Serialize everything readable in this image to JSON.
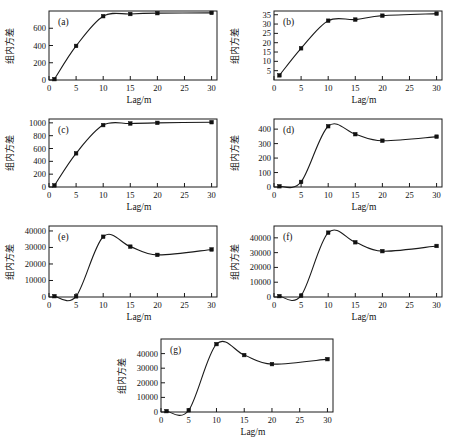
{
  "figure": {
    "background": "#ffffff",
    "marker_color": "#111111",
    "line_color": "#1a1a1a",
    "panel_count": 7
  },
  "chart_data": [
    {
      "type": "line",
      "panel": "(a)",
      "title": "",
      "xlabel": "Lag/m",
      "ylabel": "组内方差",
      "xlim": [
        0,
        31
      ],
      "ylim": [
        0,
        800
      ],
      "xticks": [
        0,
        5,
        10,
        15,
        20,
        25,
        30
      ],
      "xticklabels": [
        "0",
        "5",
        "10",
        "15",
        "20",
        "25",
        "30"
      ],
      "yticks": [
        0,
        200,
        400,
        600
      ],
      "yticklabels": [
        "0",
        "200",
        "400",
        "600"
      ],
      "grid": false,
      "x": [
        1,
        5,
        10,
        15,
        20,
        30
      ],
      "values": [
        10,
        395,
        740,
        765,
        775,
        778
      ]
    },
    {
      "type": "line",
      "panel": "(b)",
      "title": "",
      "xlabel": "Lag/m",
      "ylabel": "组内方差",
      "xlim": [
        0,
        31
      ],
      "ylim": [
        0,
        37
      ],
      "xticks": [
        0,
        5,
        10,
        15,
        20,
        25,
        30
      ],
      "xticklabels": [
        "0",
        "5",
        "10",
        "15",
        "20",
        "25",
        "30"
      ],
      "yticks": [
        5,
        10,
        15,
        20,
        25,
        30,
        35
      ],
      "yticklabels": [
        "5",
        "10",
        "15",
        "20",
        "25",
        "30",
        "35"
      ],
      "grid": false,
      "x": [
        1,
        5,
        10,
        15,
        20,
        30
      ],
      "values": [
        2.5,
        17,
        31.8,
        32.4,
        34.5,
        35.6
      ]
    },
    {
      "type": "line",
      "panel": "(c)",
      "title": "",
      "xlabel": "Lag/m",
      "ylabel": "组内方差",
      "xlim": [
        0,
        31
      ],
      "ylim": [
        0,
        1060
      ],
      "xticks": [
        0,
        5,
        10,
        15,
        20,
        25,
        30
      ],
      "xticklabels": [
        "0",
        "5",
        "10",
        "15",
        "20",
        "25",
        "30"
      ],
      "yticks": [
        0,
        200,
        400,
        600,
        800,
        1000
      ],
      "yticklabels": [
        "0",
        "200",
        "400",
        "600",
        "800",
        "1000"
      ],
      "grid": false,
      "x": [
        1,
        5,
        10,
        15,
        20,
        30
      ],
      "values": [
        25,
        525,
        965,
        990,
        1000,
        1010
      ]
    },
    {
      "type": "line",
      "panel": "(d)",
      "title": "",
      "xlabel": "Lag/m",
      "ylabel": "组内方差",
      "xlim": [
        0,
        31
      ],
      "ylim": [
        0,
        470
      ],
      "xticks": [
        0,
        5,
        10,
        15,
        20,
        25,
        30
      ],
      "xticklabels": [
        "0",
        "5",
        "10",
        "15",
        "20",
        "25",
        "30"
      ],
      "yticks": [
        0,
        100,
        200,
        300,
        400
      ],
      "yticklabels": [
        "0",
        "100",
        "200",
        "300",
        "400"
      ],
      "grid": false,
      "x": [
        1,
        5,
        10,
        15,
        20,
        30
      ],
      "values": [
        5,
        35,
        420,
        365,
        320,
        348
      ]
    },
    {
      "type": "line",
      "panel": "(e)",
      "title": "",
      "xlabel": "Lag/m",
      "ylabel": "组内方差",
      "xlim": [
        0,
        31
      ],
      "ylim": [
        0,
        43000
      ],
      "xticks": [
        0,
        5,
        10,
        15,
        20,
        25,
        30
      ],
      "xticklabels": [
        "0",
        "5",
        "10",
        "15",
        "20",
        "25",
        "30"
      ],
      "yticks": [
        0,
        10000,
        20000,
        30000,
        40000
      ],
      "yticklabels": [
        "0",
        "10000",
        "20000",
        "30000",
        "40000"
      ],
      "grid": false,
      "x": [
        1,
        5,
        10,
        15,
        20,
        30
      ],
      "values": [
        500,
        400,
        36500,
        30500,
        25500,
        28800
      ]
    },
    {
      "type": "line",
      "panel": "(f)",
      "title": "",
      "xlabel": "Lag/m",
      "ylabel": "组内方差",
      "xlim": [
        0,
        31
      ],
      "ylim": [
        0,
        48000
      ],
      "xticks": [
        0,
        5,
        10,
        15,
        20,
        25,
        30
      ],
      "xticklabels": [
        "0",
        "5",
        "10",
        "15",
        "20",
        "25",
        "30"
      ],
      "yticks": [
        0,
        10000,
        20000,
        30000,
        40000
      ],
      "yticklabels": [
        "0",
        "10000",
        "20000",
        "30000",
        "40000"
      ],
      "grid": false,
      "x": [
        1,
        5,
        10,
        15,
        20,
        30
      ],
      "values": [
        600,
        900,
        43500,
        37000,
        31000,
        34500
      ]
    },
    {
      "type": "line",
      "panel": "(g)",
      "title": "",
      "xlabel": "Lag/m",
      "ylabel": "组内方差",
      "xlim": [
        0,
        31
      ],
      "ylim": [
        0,
        50000
      ],
      "xticks": [
        0,
        5,
        10,
        15,
        20,
        25,
        30
      ],
      "xticklabels": [
        "0",
        "5",
        "10",
        "15",
        "20",
        "25",
        "30"
      ],
      "yticks": [
        0,
        10000,
        20000,
        30000,
        40000
      ],
      "yticklabels": [
        "0",
        "10000",
        "20000",
        "30000",
        "40000"
      ],
      "grid": false,
      "x": [
        1,
        5,
        10,
        15,
        20,
        30
      ],
      "values": [
        600,
        1200,
        46500,
        39000,
        32800,
        36200
      ]
    }
  ]
}
